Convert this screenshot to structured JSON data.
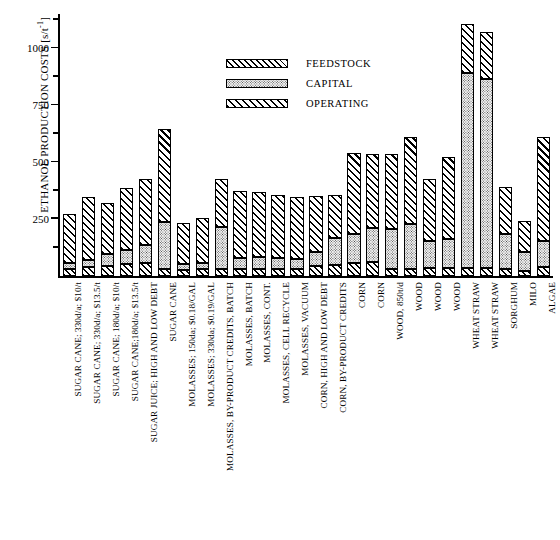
{
  "chart_data": {
    "type": "bar",
    "subtype": "stacked-vertical",
    "title": "",
    "xlabel": "",
    "ylabel": "ETHANOL PRODUCTION COSTS [s/t-1]",
    "ylabel_main": "ETHANOL PRODUCTION COSTS [s/t",
    "ylabel_sup": "-1",
    "ylabel_tail": "]",
    "ylim": [
      0,
      1150
    ],
    "yticks": [
      250,
      500,
      750,
      1000
    ],
    "ytick_labels": [
      "250",
      "500",
      "750",
      "1000"
    ],
    "yminor_ticks": [
      125,
      375,
      625,
      875,
      1125
    ],
    "grid": false,
    "legend_position": "upper-center",
    "categories": [
      "SUGAR CANE; 330d/a; $10/t",
      "SUGAR CANE; 330d/a; $13.5/t",
      "SUGAR CANE; 180d/a; $10/t",
      "SUGAR CANE;180d/a; $13.5/t",
      "SUGAR JUICE; HIGH AND LOW DEBT",
      "SUGAR CANE",
      "MOLASSES; 150da; $0.18/GAL",
      "MOLASSES; 330da; $0.19/GAL",
      "MOLASSES, BY-PRODUCT CREDITS, BATCH",
      "MOLASSES, BATCH",
      "MOLASSES, CONT.",
      "MOLASSES, CELL RECYCLE",
      "MOLASSES, VACUUM",
      "CORN, HIGH AND LOW DEBT",
      "CORN, BY-PRODUCT CREDITS",
      "CORN",
      "CORN",
      "WOOD, 850t/d",
      "WOOD",
      "WOOD",
      "WOOD",
      "WHEAT STRAW",
      "WHEAT STRAW",
      "SORGHUM",
      "MILO",
      "ALGAE"
    ],
    "series": [
      {
        "name": "FEEDSTOCK",
        "pattern": "diagonal-hatch",
        "values": [
          30,
          38,
          45,
          52,
          58,
          30,
          28,
          30,
          30,
          32,
          32,
          32,
          30,
          45,
          48,
          58,
          60,
          30,
          32,
          34,
          36,
          36,
          34,
          30,
          24,
          40
        ]
      },
      {
        "name": "CAPITAL",
        "pattern": "stipple-dots",
        "values": [
          28,
          34,
          52,
          62,
          80,
          205,
          26,
          26,
          185,
          45,
          52,
          48,
          44,
          62,
          118,
          128,
          150,
          175,
          195,
          120,
          128,
          855,
          830,
          155,
          82,
          115
        ]
      },
      {
        "name": "OPERATING",
        "pattern": "diagonal-hatch",
        "values": [
          215,
          275,
          222,
          272,
          290,
          410,
          178,
          200,
          210,
          295,
          285,
          275,
          275,
          243,
          188,
          352,
          325,
          330,
          382,
          270,
          360,
          215,
          205,
          205,
          134,
          455
        ]
      }
    ],
    "totals": [
      273,
      347,
      319,
      386,
      428,
      645,
      232,
      256,
      425,
      372,
      369,
      355,
      349,
      350,
      354,
      538,
      535,
      535,
      609,
      424,
      524,
      1106,
      1069,
      390,
      240,
      610
    ]
  },
  "legend": {
    "items": [
      {
        "label": "FEEDSTOCK",
        "pattern": "diagonal-hatch"
      },
      {
        "label": "CAPITAL",
        "pattern": "stipple-dots"
      },
      {
        "label": "OPERATING",
        "pattern": "diagonal-hatch"
      }
    ]
  }
}
